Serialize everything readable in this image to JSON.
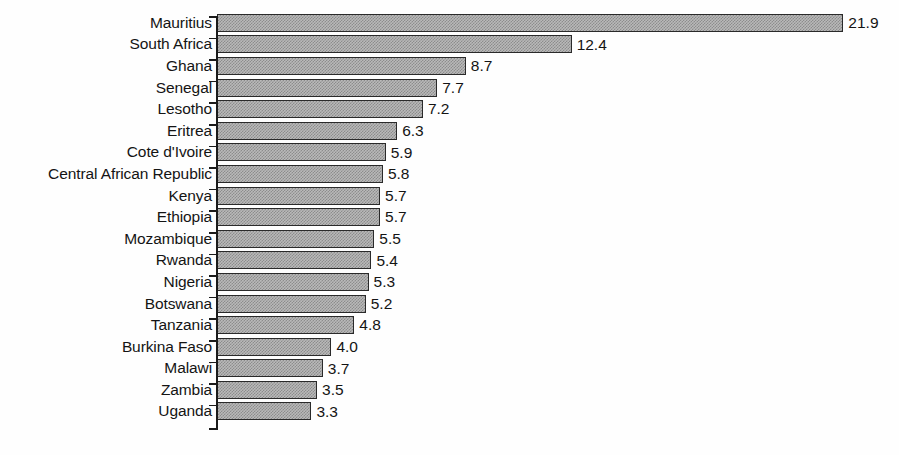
{
  "chart_data": {
    "type": "bar",
    "orientation": "horizontal",
    "title": "",
    "subtitle": "",
    "xlabel": "",
    "ylabel": "",
    "xlim": [
      0,
      21.9
    ],
    "grid": false,
    "legend": null,
    "axis": {
      "category_axis": "vertical-left",
      "value_axis_visible": false,
      "ticks_between_categories": true
    },
    "value_label_format": "one-decimal",
    "categories": [
      "Mauritius",
      "South Africa",
      "Ghana",
      "Senegal",
      "Lesotho",
      "Eritrea",
      "Cote d'Ivoire",
      "Central African Republic",
      "Kenya",
      "Ethiopia",
      "Mozambique",
      "Rwanda",
      "Nigeria",
      "Botswana",
      "Tanzania",
      "Burkina Faso",
      "Malawi",
      "Zambia",
      "Uganda"
    ],
    "values": [
      21.9,
      12.4,
      8.7,
      7.7,
      7.2,
      6.3,
      5.9,
      5.8,
      5.7,
      5.7,
      5.5,
      5.4,
      5.3,
      5.2,
      4.8,
      4.0,
      3.7,
      3.5,
      3.3
    ],
    "value_labels": [
      "21.9",
      "12.4",
      "8.7",
      "7.7",
      "7.2",
      "6.3",
      "5.9",
      "5.8",
      "5.7",
      "5.7",
      "5.5",
      "5.4",
      "5.3",
      "5.2",
      "4.8",
      "4.0",
      "3.7",
      "3.5",
      "3.3"
    ],
    "bars": [
      {
        "category": "Mauritius",
        "value": 21.9,
        "label": "21.9"
      },
      {
        "category": "South Africa",
        "value": 12.4,
        "label": "12.4"
      },
      {
        "category": "Ghana",
        "value": 8.7,
        "label": "8.7"
      },
      {
        "category": "Senegal",
        "value": 7.7,
        "label": "7.7"
      },
      {
        "category": "Lesotho",
        "value": 7.2,
        "label": "7.2"
      },
      {
        "category": "Eritrea",
        "value": 6.3,
        "label": "6.3"
      },
      {
        "category": "Cote d'Ivoire",
        "value": 5.9,
        "label": "5.9"
      },
      {
        "category": "Central African Republic",
        "value": 5.8,
        "label": "5.8"
      },
      {
        "category": "Kenya",
        "value": 5.7,
        "label": "5.7"
      },
      {
        "category": "Ethiopia",
        "value": 5.7,
        "label": "5.7"
      },
      {
        "category": "Mozambique",
        "value": 5.5,
        "label": "5.5"
      },
      {
        "category": "Rwanda",
        "value": 5.4,
        "label": "5.4"
      },
      {
        "category": "Nigeria",
        "value": 5.3,
        "label": "5.3"
      },
      {
        "category": "Botswana",
        "value": 5.2,
        "label": "5.2"
      },
      {
        "category": "Tanzania",
        "value": 4.8,
        "label": "4.8"
      },
      {
        "category": "Burkina Faso",
        "value": 4.0,
        "label": "4.0"
      },
      {
        "category": "Malawi",
        "value": 3.7,
        "label": "3.7"
      },
      {
        "category": "Zambia",
        "value": 3.5,
        "label": "3.5"
      },
      {
        "category": "Uganda",
        "value": 3.3,
        "label": "3.3"
      }
    ],
    "style": {
      "bar_fill": "#b9b9b9",
      "bar_fill_pattern": "dither-50-gray",
      "bar_border": "#2a2a2a",
      "axis_color": "#1b1b1b",
      "text_color": "#141414",
      "background": "#ffffff"
    },
    "px_per_unit": 28.6
  }
}
